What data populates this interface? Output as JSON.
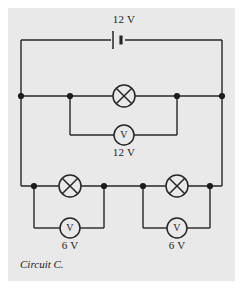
{
  "figure": {
    "caption": "Circuit C.",
    "background_color": "#e9e9e9",
    "page_color": "#ffffff",
    "wire_color": "#262626",
    "text_color": "#1c1c1c"
  },
  "components": {
    "battery": {
      "symbol": "battery-cell",
      "label": "12 V",
      "x": 118,
      "y": 40
    },
    "lamp_top": {
      "symbol": "lamp",
      "x": 124,
      "y": 96
    },
    "voltmeter_top": {
      "symbol": "voltmeter",
      "letter": "V",
      "label": "12 V",
      "x": 124,
      "y": 135
    },
    "lamp_bottom_left": {
      "symbol": "lamp",
      "x": 70,
      "y": 186
    },
    "voltmeter_bottom_left": {
      "symbol": "voltmeter",
      "letter": "V",
      "label": "6 V",
      "x": 70,
      "y": 228
    },
    "lamp_bottom_right": {
      "symbol": "lamp",
      "x": 177,
      "y": 186
    },
    "voltmeter_bottom_right": {
      "symbol": "voltmeter",
      "letter": "V",
      "label": "6 V",
      "x": 177,
      "y": 228
    }
  },
  "labels": {
    "battery_voltage": "12 V",
    "voltmeter_top_reading": "12 V",
    "voltmeter_bottom_left_reading": "6 V",
    "voltmeter_bottom_right_reading": "6 V",
    "meter_letter": "V"
  }
}
